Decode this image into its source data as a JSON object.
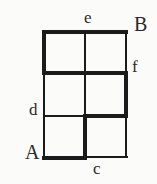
{
  "figure": {
    "type": "grid-path-diagram",
    "grid": {
      "columns": 2,
      "rows": 3
    },
    "labels": {
      "e": "e",
      "B": "B",
      "f": "f",
      "d": "d",
      "A": "A",
      "c": "c"
    },
    "label_positions": {
      "e": "above top edge, at middle vertical",
      "B": "right of top-right corner",
      "f": "right of right edge, at first interior horizontal",
      "d": "left of left edge, at second interior horizontal",
      "A": "left of bottom-left corner",
      "c": "below bottom edge, at middle vertical"
    },
    "bold_path": [
      "A (bottom-left corner)",
      "right along bottom edge to c",
      "up middle vertical to d-level",
      "right along d-level to right edge",
      "up right edge to f",
      "left along f-level to left edge",
      "up left edge to top",
      "right along top edge past e to B"
    ],
    "colors": {
      "line": "#1b1b1b",
      "background": "#fbfbf9",
      "text": "#2a2a2a"
    }
  }
}
